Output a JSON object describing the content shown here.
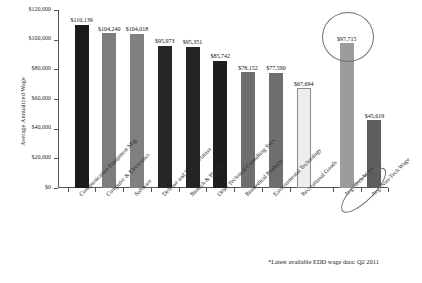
{
  "chart_data": {
    "type": "bar",
    "title": "",
    "xlabel": "",
    "ylabel": "Average Annualized Wage",
    "ylim": [
      0,
      120000
    ],
    "ytick_labels": [
      "$0",
      "$20,000",
      "$40,000",
      "$60,000",
      "$80,000",
      "$100,000",
      "$120,000"
    ],
    "ytick_values": [
      0,
      20000,
      40000,
      60000,
      80000,
      100000,
      120000
    ],
    "grid": false,
    "legend": "none",
    "categories": [
      "Communication Equipment Mfg.",
      "Computer & Electronics",
      "Software",
      "Defense and Transportation",
      "Biotech & Pharma",
      "Other Technical Consulting Svcs",
      "Biomedical Products",
      "Environmental Technology",
      "Recreational Goods",
      "Avg. Tech Wage",
      "Avg. Non-Tech Wage"
    ],
    "values": [
      110139,
      104240,
      104018,
      95973,
      95351,
      85742,
      78152,
      77590,
      67694,
      97715,
      45619
    ],
    "value_labels": [
      "$110,139",
      "$104,240",
      "$104,018",
      "$95,973",
      "$95,351",
      "$85,742",
      "$78,152",
      "$77,590",
      "$67,694",
      "$97,715",
      "$45,619"
    ],
    "bar_colors": [
      "#1a1a1a",
      "#7d7d7d",
      "#808080",
      "#262626",
      "#242424",
      "#1e1e1e",
      "#6e6e6e",
      "#6e6e6e",
      "#ededed",
      "#9c9c9c",
      "#5e5e5e"
    ],
    "annotations": [
      {
        "name": "avg-tech-wage-highlight",
        "type": "ellipse",
        "target": "Avg. Tech Wage"
      },
      {
        "name": "avg-tech-wage-label-highlight",
        "type": "ellipse",
        "target": "Avg. Tech Wage label"
      }
    ]
  },
  "footnote": "*Latest available EDD wage data: Q2 2011"
}
